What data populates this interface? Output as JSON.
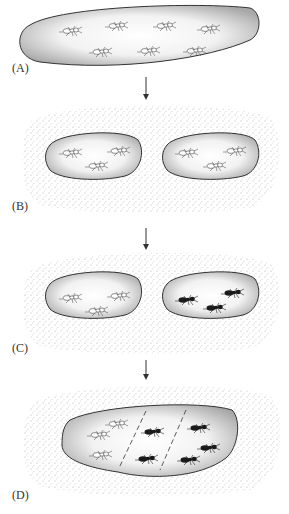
{
  "figure": {
    "panels": [
      {
        "label": "(A)",
        "description": "single large population of one ant type (7 light ants)"
      },
      {
        "label": "(B)",
        "description": "population split into two isolated habitats by barrier (3 light ants each)"
      },
      {
        "label": "(C)",
        "description": "isolated populations diverge: left light ants, right dark ants"
      },
      {
        "label": "(D)",
        "description": "habitats rejoin; hybrid zone between light and dark ants separated by dashed lines"
      }
    ],
    "colors": {
      "habitat_fill": "#d9d9d9",
      "habitat_outline": "#333333",
      "stipple": "#9a9a9a",
      "light_ant": "#ffffff",
      "dark_ant": "#1a1a1a",
      "arrow": "#333333"
    }
  }
}
